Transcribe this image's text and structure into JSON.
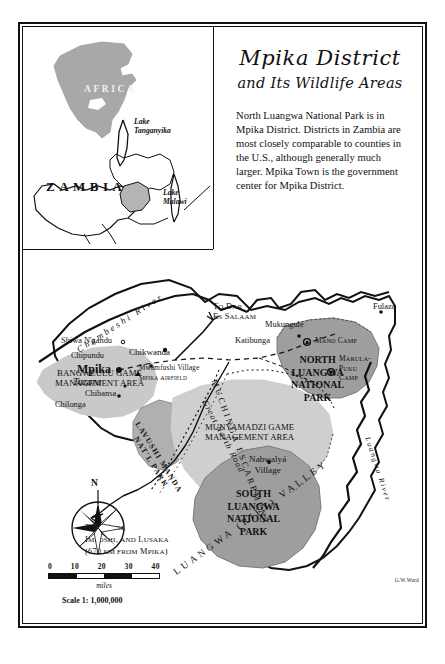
{
  "title": {
    "main": "Mpika District",
    "sub": "and Its Wildlife Areas"
  },
  "blurb": "North Luangwa National Park is in Mpika District. Districts in Zambia are most closely comparable to counties in the U.S., although generally much larger. Mpika Town is the government center for Mpika District.",
  "inset": {
    "continent": "AFRICA",
    "country": "ZAMBIA",
    "lake_tanganyika": "Lake\nTanganyika",
    "lake_malawi": "Lake\nMalawi"
  },
  "map": {
    "rivers": {
      "chambeshi": "Chambeshi River",
      "luangwa": "Luangwa River"
    },
    "roads": {
      "great_north": "Great North Road"
    },
    "escarpment": "MUCHINGA ESCARPMENT",
    "valley": "LUANGWA (RIFT) VALLEY",
    "towns": [
      {
        "name": "Shiwa N'gandu"
      },
      {
        "name": "Chipundu"
      },
      {
        "name": "Mpika"
      },
      {
        "name": "Tazara"
      },
      {
        "name": "Chibansa"
      },
      {
        "name": "Chilonga"
      },
      {
        "name": "Chikwanda"
      },
      {
        "name": "Mwamfushi Village"
      },
      {
        "name": "Mpika Airfield"
      },
      {
        "name": "Katibunga"
      },
      {
        "name": "Mukungule"
      },
      {
        "name": "Fulaza"
      },
      {
        "name": "Nabwalyá Village"
      }
    ],
    "camps": [
      {
        "name": "Mano Camp"
      },
      {
        "name": "Marula-Puku Camp"
      }
    ],
    "areas": [
      {
        "name": "BANGWEULU GAME MANAGEMENT AREA"
      },
      {
        "name": "MUNYAMADZI GAME MANAGEMENT AREA"
      }
    ],
    "parks": [
      {
        "name": "LAVUSHI MANDA NAT'L PARK"
      },
      {
        "name": "NORTH LUANGWA NATIONAL PARK"
      },
      {
        "name": "SOUTH LUANGWA NATIONAL PARK"
      }
    ],
    "directions": [
      {
        "text": "To Dar\nEs Salaam"
      },
      {
        "text": "To Kapiri,\nImposhi, and Lusaka\n(670 km from Mpika)"
      }
    ]
  },
  "compass": {
    "north": "N"
  },
  "scale": {
    "ticks": [
      "0",
      "10",
      "20",
      "30",
      "40"
    ],
    "unit": "miles",
    "ratio": "Scale 1: 1,000,000"
  },
  "credit": "G.W.Ward",
  "colors": {
    "land": "#ffffff",
    "gma": "#c9c9c9",
    "park": "#9e9e9e",
    "ink": "#111111"
  }
}
